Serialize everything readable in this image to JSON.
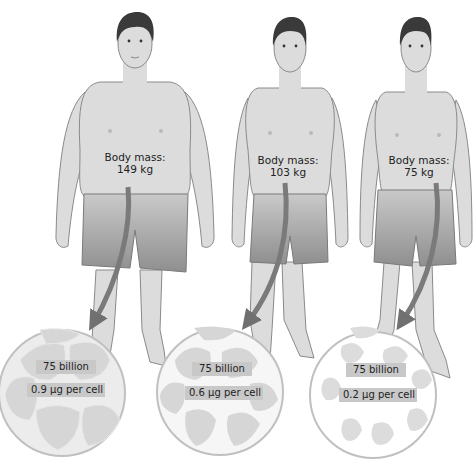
{
  "figures": [
    {
      "id": "obese",
      "mass_label": "Body mass:",
      "mass_value": "149 kg",
      "cells_count": "75 billion",
      "cell_mass": "0.9 μg per cell"
    },
    {
      "id": "overweight",
      "mass_label": "Body mass:",
      "mass_value": "103 kg",
      "cells_count": "75 billion",
      "cell_mass": "0.6 μg per cell"
    },
    {
      "id": "lean",
      "mass_label": "Body mass:",
      "mass_value": "75 kg",
      "cells_count": "75 billion",
      "cell_mass": "0.2 μg per cell"
    }
  ],
  "colors": {
    "skin": "#dcdcdc",
    "outline": "#8a8a8a",
    "hair": "#3a3a3a",
    "shorts": "#a9a9a9",
    "arrow": "#7a7a7a",
    "cell": "#d6d6d6",
    "tag_bg": "#c8c8c8"
  }
}
